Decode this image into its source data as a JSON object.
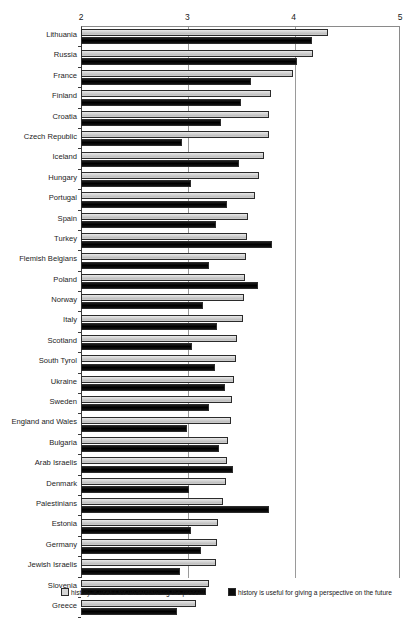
{
  "title_fragment": "",
  "legend": {
    "position": "bottom",
    "entries": [
      {
        "key": "present",
        "label": "history is useful for understanding the present",
        "swatch": "light"
      },
      {
        "key": "future",
        "label": "history is useful for giving a perspective on the future",
        "swatch": "dark"
      }
    ]
  },
  "chart_data": {
    "type": "bar",
    "orientation": "horizontal",
    "title": "",
    "xlabel": "",
    "ylabel": "",
    "xlim": [
      2,
      5
    ],
    "xticks": [
      2,
      3,
      4,
      5
    ],
    "xtick_labels": [
      "2",
      "3",
      "4",
      "5"
    ],
    "grid": true,
    "legend_position": "bottom",
    "categories": [
      "Lithuania",
      "Russia",
      "France",
      "Finland",
      "Croatia",
      "Czech Republic",
      "Iceland",
      "Hungary",
      "Portugal",
      "Spain",
      "Turkey",
      "Flemish Belgians",
      "Poland",
      "Norway",
      "Italy",
      "Scotland",
      "South Tyrol",
      "Ukraine",
      "Sweden",
      "England and Wales",
      "Bulgaria",
      "Arab Israelis",
      "Denmark",
      "Palestinians",
      "Estonia",
      "Germany",
      "Jewish Israelis",
      "Slovenia",
      "Greece"
    ],
    "series": [
      {
        "name": "history is useful for understanding the present",
        "style": "light",
        "values": [
          4.32,
          4.18,
          3.99,
          3.79,
          3.77,
          3.77,
          3.72,
          3.67,
          3.64,
          3.57,
          3.56,
          3.55,
          3.54,
          3.53,
          3.52,
          3.47,
          3.46,
          3.44,
          3.42,
          3.41,
          3.38,
          3.37,
          3.36,
          3.34,
          3.29,
          3.28,
          3.27,
          3.2,
          3.08
        ]
      },
      {
        "name": "history is useful for giving a perspective on the future",
        "style": "dark",
        "values": [
          4.17,
          4.03,
          3.6,
          3.5,
          3.32,
          2.95,
          3.49,
          3.03,
          3.37,
          3.27,
          3.8,
          3.2,
          3.66,
          3.15,
          3.28,
          3.04,
          3.26,
          3.35,
          3.2,
          3.0,
          3.3,
          3.43,
          3.02,
          3.77,
          3.03,
          3.13,
          2.93,
          3.18,
          2.9
        ]
      }
    ]
  }
}
